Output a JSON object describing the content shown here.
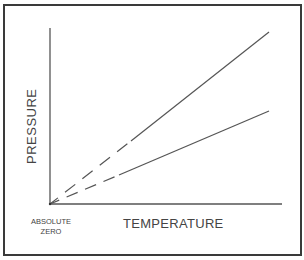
{
  "diagram": {
    "title": "",
    "y_axis_label": "PRESSURE",
    "x_axis_label": "TEMPERATURE",
    "origin_label_line1": "ABSOLUTE",
    "origin_label_line2": "ZERO",
    "lines": [
      {
        "name": "steeper-line",
        "solid_from": [
          133,
          140
        ],
        "end": [
          269,
          32
        ],
        "extrapolated_dashed_to": [
          50,
          204
        ]
      },
      {
        "name": "shallower-line",
        "solid_from": [
          120,
          174
        ],
        "end": [
          269,
          111
        ],
        "extrapolated_dashed_to": [
          50,
          204
        ]
      }
    ],
    "colors": {
      "line": "#555555",
      "frame": "#3a3a3a",
      "text": "#444444"
    }
  }
}
